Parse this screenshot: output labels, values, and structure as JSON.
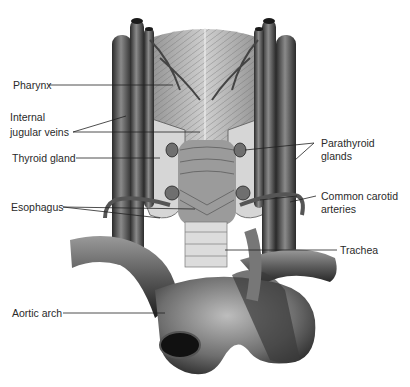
{
  "figure": {
    "labels_left": [
      {
        "id": "pharynx",
        "text": "Pharynx"
      },
      {
        "id": "internal-jugular-veins",
        "line1": "Internal",
        "line2": "jugular veins"
      },
      {
        "id": "thyroid-gland",
        "text": "Thyroid gland"
      },
      {
        "id": "esophagus",
        "text": "Esophagus"
      },
      {
        "id": "aortic-arch",
        "text": "Aortic arch"
      }
    ],
    "labels_right": [
      {
        "id": "parathyroid-glands",
        "line1": "Parathyroid",
        "line2": "glands"
      },
      {
        "id": "common-carotid-arteries",
        "line1": "Common carotid",
        "line2": "arteries"
      },
      {
        "id": "trachea",
        "text": "Trachea"
      }
    ],
    "colors": {
      "background": "#ffffff",
      "vessel_dark": "#2e2e2e",
      "vessel_mid": "#6a6a6a",
      "tissue_light": "#c8c8c8",
      "leader_line": "#222222",
      "text": "#2a2a2a"
    }
  }
}
